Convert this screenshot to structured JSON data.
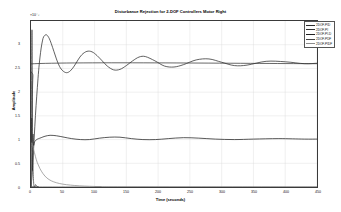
{
  "chart_data": {
    "type": "line",
    "title": "Disturbance Rejection for 2-DOF Controllers Motor Right",
    "xlabel": "Time (seconds)",
    "ylabel": "Amplitude",
    "y_exponent_label": "×10⁻³",
    "xlim": [
      0,
      450
    ],
    "ylim": [
      0,
      3.5
    ],
    "xticks": [
      0,
      50,
      100,
      150,
      200,
      250,
      300,
      350,
      400,
      450
    ],
    "xticklabels": [
      "0",
      "50",
      "100",
      "150",
      "200",
      "250",
      "300",
      "350",
      "400",
      "450"
    ],
    "yticks": [
      0,
      0.5,
      1,
      1.5,
      2,
      2.5,
      3
    ],
    "yticklabels": [
      "0",
      "0.5",
      "1",
      "1.5",
      "2",
      "2.5",
      "3"
    ],
    "grid": true,
    "legend_position": "upper right",
    "series": [
      {
        "name": "2DOF-PID",
        "color": "#2a2a2a",
        "description": "Underdamped oscillatory response rising to peak 3.21e-3 then ringing down to steady state 2.61e-3",
        "x": [
          0,
          2,
          4,
          6,
          8,
          10,
          12,
          14,
          16,
          18,
          20,
          24,
          28,
          32,
          36,
          40,
          45,
          50,
          56,
          62,
          68,
          74,
          80,
          88,
          96,
          104,
          112,
          120,
          130,
          140,
          150,
          160,
          170,
          180,
          195,
          210,
          225,
          240,
          260,
          280,
          300,
          320,
          340,
          370,
          400,
          430,
          450
        ],
        "y": [
          0.0,
          0.3,
          0.78,
          1.28,
          1.72,
          2.1,
          2.45,
          2.72,
          2.93,
          3.08,
          3.17,
          3.21,
          3.15,
          3.02,
          2.86,
          2.7,
          2.54,
          2.45,
          2.41,
          2.45,
          2.55,
          2.68,
          2.79,
          2.86,
          2.85,
          2.77,
          2.66,
          2.55,
          2.47,
          2.48,
          2.56,
          2.66,
          2.74,
          2.75,
          2.66,
          2.55,
          2.53,
          2.58,
          2.68,
          2.7,
          2.63,
          2.56,
          2.57,
          2.65,
          2.64,
          2.6,
          2.61
        ]
      },
      {
        "name": "2DOF-PI",
        "color": "#333333",
        "description": "Flat reference/steady level at 2.60e-3 across full time range",
        "x": [
          0,
          1.5,
          3,
          6,
          450
        ],
        "y": [
          0.0,
          1.3,
          2.35,
          2.6,
          2.6
        ]
      },
      {
        "name": "2DOF-PI-D",
        "color": "#1f1f1f",
        "description": "Fast transient spike then settles near 1.00e-3 with small residual ripple",
        "x": [
          0,
          1,
          2,
          3,
          4,
          6,
          9,
          12,
          16,
          22,
          30,
          40,
          52,
          64,
          78,
          92,
          108,
          124,
          140,
          158,
          176,
          196,
          216,
          240,
          264,
          290,
          320,
          350,
          390,
          430,
          450
        ],
        "y": [
          0.0,
          1.45,
          0.35,
          1.1,
          0.88,
          0.96,
          1.0,
          1.02,
          1.04,
          1.07,
          1.09,
          1.08,
          1.05,
          1.02,
          1.0,
          1.0,
          1.03,
          1.05,
          1.05,
          1.02,
          1.0,
          1.0,
          1.02,
          1.04,
          1.03,
          1.01,
          1.0,
          1.01,
          1.02,
          1.01,
          1.01
        ]
      },
      {
        "name": "2DOF-PDF",
        "color": "#444444",
        "description": "Sharp narrow spike at origin falling to zero by t=12",
        "x": [
          0,
          0.8,
          1.6,
          2.4,
          3.2,
          4.2,
          5.5,
          7,
          9,
          12,
          18,
          450
        ],
        "y": [
          0.0,
          2.05,
          3.3,
          1.25,
          0.45,
          0.08,
          0.0,
          0.05,
          0.02,
          0.0,
          0.0,
          0.0
        ]
      },
      {
        "name": "2DOF-PIDF",
        "color": "#8c8c8c",
        "description": "Monotonic exponential decay from 0.90e-3 to zero",
        "x": [
          0,
          1,
          2,
          4,
          7,
          10,
          14,
          19,
          25,
          32,
          40,
          50,
          62,
          76,
          92,
          110,
          130,
          450
        ],
        "y": [
          0.0,
          0.85,
          0.9,
          0.8,
          0.64,
          0.51,
          0.39,
          0.28,
          0.19,
          0.13,
          0.09,
          0.06,
          0.04,
          0.025,
          0.015,
          0.008,
          0.004,
          0.0
        ]
      }
    ]
  }
}
